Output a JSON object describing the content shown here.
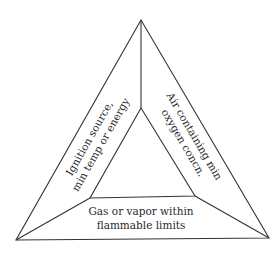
{
  "diagram": {
    "type": "fire-triangle",
    "outer_triangle": {
      "top": [
        141,
        20
      ],
      "bottom_left": [
        16,
        240
      ],
      "bottom_right": [
        269,
        238
      ]
    },
    "inner_triangle": {
      "top": [
        141,
        108
      ],
      "bottom_left": [
        90,
        198
      ],
      "bottom_right": [
        195,
        196
      ]
    },
    "stroke_color": "#333333",
    "panels": {
      "left": {
        "lines": [
          "Ignition source,",
          "min temp or energy"
        ]
      },
      "right": {
        "lines": [
          "Air containing min",
          "oxygen concn."
        ]
      },
      "bottom": {
        "lines": [
          "Gas or vapor within",
          "flammable limits"
        ]
      }
    }
  }
}
